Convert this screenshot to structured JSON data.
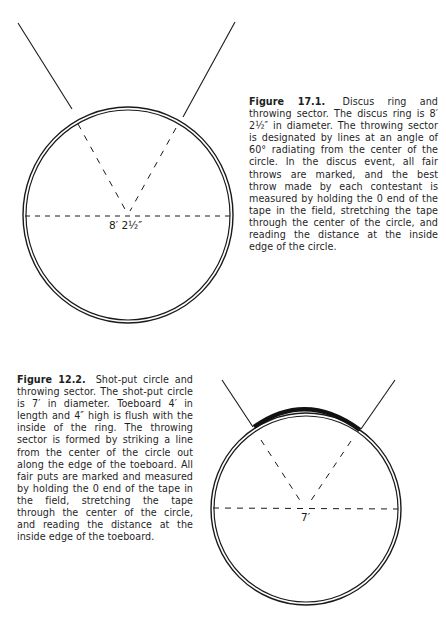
{
  "figures": [
    {
      "id": "17.1",
      "label": "Figure 17.1.",
      "caption": "Discus ring and throwing sector. The discus ring is 8′ 2½″ in diameter. The throwing sector is designated by lines at an angle of 60° radiating from the center of the circle. In the discus event, all fair throws are marked, and the best throw made by each contestant is measured by holding the 0 end of the tape in the field, stretching the tape through the center of the circle, and reading the distance at the inside edge of the circle.",
      "diameter_label": "8′  2½″",
      "sector_angle": "60°",
      "diagram": "discus-ring"
    },
    {
      "id": "12.2",
      "label": "Figure 12.2.",
      "caption": "Shot-put circle and throwing sector. The shot-put circle is 7′ in diameter. Toeboard 4′ in length and 4″ high is flush with the inside of the ring. The throwing sector is formed by striking a line from the center of the circle out along the edge of the toeboard. All fair puts are marked and measured by holding the 0 end of the tape in the field, stretching the tape through the center of the circle, and reading the distance at the inside edge of the toeboard.",
      "diameter_label": "7′",
      "diagram": "shot-put-circle"
    }
  ],
  "colors": {
    "ink": "#1a1a1a",
    "paper": "#ffffff"
  }
}
